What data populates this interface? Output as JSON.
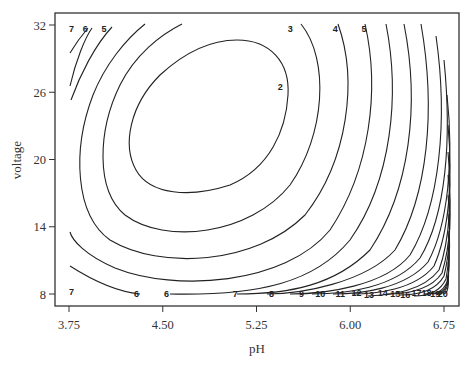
{
  "chart_data": {
    "type": "contour",
    "title": "",
    "xlabel": "pH",
    "ylabel": "voltage",
    "xlim": [
      3.6,
      6.85
    ],
    "ylim": [
      7.0,
      33.0
    ],
    "x_ticks": [
      3.75,
      4.5,
      5.25,
      6.0,
      6.75
    ],
    "x_tick_labels": [
      "3.75",
      "4.50",
      "5.25",
      "6.00",
      "6.75"
    ],
    "y_ticks": [
      8,
      14,
      20,
      26,
      32
    ],
    "y_tick_labels": [
      "8",
      "14",
      "20",
      "26",
      "32"
    ],
    "grid": false,
    "minimum_region": {
      "pH": 4.9,
      "voltage": 22.5
    },
    "contour_levels": [
      2,
      3,
      4,
      5,
      6,
      7,
      8,
      9,
      10,
      11,
      12,
      13,
      14,
      15,
      16,
      17,
      18,
      19,
      20
    ],
    "contour_labels": {
      "top": [
        {
          "text": "7",
          "pH": 3.77,
          "voltage": 31.6
        },
        {
          "text": "6",
          "pH": 3.88,
          "voltage": 31.6
        },
        {
          "text": "5",
          "pH": 4.03,
          "voltage": 31.6
        },
        {
          "text": "3",
          "pH": 5.52,
          "voltage": 31.6
        },
        {
          "text": "4",
          "pH": 5.88,
          "voltage": 31.6
        },
        {
          "text": "5",
          "pH": 6.11,
          "voltage": 31.6
        }
      ],
      "interior": [
        {
          "text": "2",
          "pH": 5.44,
          "voltage": 26.5
        }
      ],
      "bottom": [
        {
          "text": "7",
          "pH": 3.77,
          "voltage": 8.2
        },
        {
          "text": "6",
          "pH": 4.29,
          "voltage": 8.0
        },
        {
          "text": "6",
          "pH": 4.53,
          "voltage": 8.0
        },
        {
          "text": "7",
          "pH": 5.08,
          "voltage": 8.0
        },
        {
          "text": "8",
          "pH": 5.37,
          "voltage": 8.0
        },
        {
          "text": "9",
          "pH": 5.61,
          "voltage": 8.0
        },
        {
          "text": "10",
          "pH": 5.76,
          "voltage": 8.0
        },
        {
          "text": "11",
          "pH": 5.92,
          "voltage": 8.0
        },
        {
          "text": "12",
          "pH": 6.05,
          "voltage": 8.1
        },
        {
          "text": "13",
          "pH": 6.15,
          "voltage": 7.9
        },
        {
          "text": "14",
          "pH": 6.26,
          "voltage": 8.1
        },
        {
          "text": "15",
          "pH": 6.36,
          "voltage": 8.0
        },
        {
          "text": "16",
          "pH": 6.44,
          "voltage": 7.9
        },
        {
          "text": "17",
          "pH": 6.53,
          "voltage": 8.1
        },
        {
          "text": "18",
          "pH": 6.61,
          "voltage": 8.1
        },
        {
          "text": "19",
          "pH": 6.68,
          "voltage": 8.0
        },
        {
          "text": "20",
          "pH": 6.74,
          "voltage": 8.0
        }
      ]
    }
  }
}
